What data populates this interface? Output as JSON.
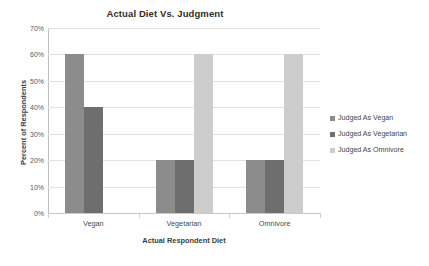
{
  "chart_data": {
    "type": "bar",
    "title": "Actual Diet Vs. Judgment",
    "xlabel": "Actual Respondent Diet",
    "ylabel": "Percent of Respondents",
    "categories": [
      "Vegan",
      "Vegetarian",
      "Omnivore"
    ],
    "series": [
      {
        "name": "Judged As Vegan",
        "color": "#8c8c8c",
        "values": [
          60,
          20,
          20
        ]
      },
      {
        "name": "Judged As Vegetarian",
        "color": "#6e6e6e",
        "values": [
          40,
          20,
          20
        ]
      },
      {
        "name": "Judged As Omnivore",
        "color": "#cdcdcd",
        "values": [
          0,
          60,
          60
        ]
      }
    ],
    "ylim": [
      0,
      70
    ],
    "y_tick_labels": [
      "70%",
      "60%",
      "50%",
      "40%",
      "30%",
      "20%",
      "10%",
      "0%"
    ],
    "y_tick_values": [
      70,
      60,
      50,
      40,
      30,
      20,
      10,
      0
    ],
    "grid": true,
    "legend_position": "right"
  }
}
